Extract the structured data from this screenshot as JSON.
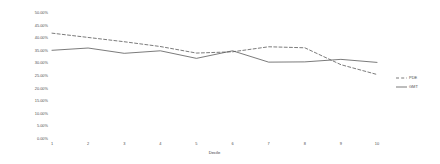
{
  "chart_data": {
    "type": "line",
    "title": "",
    "xlabel": "Decile",
    "ylabel": "Discount/mortality ratio",
    "categories": [
      "1",
      "2",
      "3",
      "4",
      "5",
      "6",
      "7",
      "8",
      "9",
      "10"
    ],
    "x": [
      1,
      2,
      3,
      4,
      5,
      6,
      7,
      8,
      9,
      10
    ],
    "ylim": [
      0,
      50
    ],
    "xlim": [
      1,
      10
    ],
    "grid": false,
    "legend_position": "right",
    "y_ticks": [
      "50.00%",
      "45.00%",
      "40.00%",
      "35.00%",
      "30.00%",
      "25.00%",
      "20.00%",
      "15.00%",
      "10.00%",
      "5.00%",
      "0.00%"
    ],
    "y_tick_values": [
      50,
      45,
      40,
      35,
      30,
      25,
      20,
      15,
      10,
      5,
      0
    ],
    "series": [
      {
        "name": "PDE",
        "style": "dashed",
        "color": "#595959",
        "values": [
          42.0,
          40.3,
          38.6,
          36.7,
          34.1,
          34.6,
          36.6,
          36.2,
          29.5,
          25.6
        ]
      },
      {
        "name": "GMT",
        "style": "solid",
        "color": "#595959",
        "values": [
          35.2,
          36.1,
          34.0,
          35.0,
          32.0,
          35.0,
          30.5,
          30.6,
          31.6,
          30.4
        ]
      }
    ]
  },
  "legend": {
    "items": [
      {
        "label": "PDE",
        "style": "dashed"
      },
      {
        "label": "GMT",
        "style": "solid"
      }
    ]
  },
  "axes": {
    "x_title": "Decile",
    "y_title": "Discount/mortality ratio"
  }
}
